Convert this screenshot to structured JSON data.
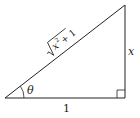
{
  "diagram": {
    "type": "right-triangle",
    "labels": {
      "hypotenuse": "√(x² + 1)",
      "hyp_radicand": "x",
      "hyp_exp": "2",
      "hyp_plus": "+ 1",
      "opposite": "x",
      "adjacent": "1",
      "angle": "θ"
    },
    "colors": {
      "stroke": "#222222",
      "background": "#ffffff"
    }
  }
}
